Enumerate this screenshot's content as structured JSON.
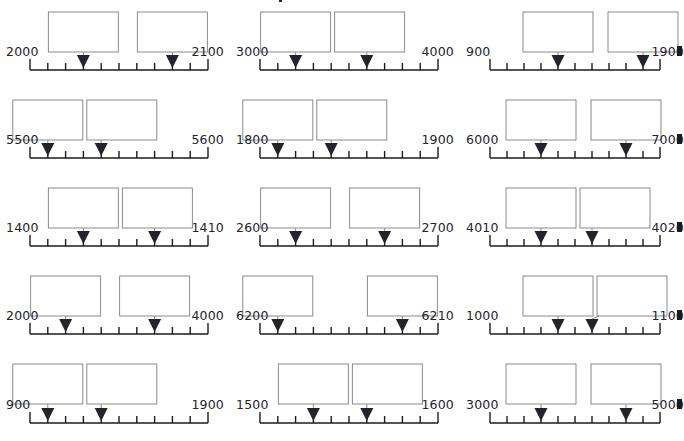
{
  "page": {
    "kind": "number-line-placement-exercise",
    "columns": 3,
    "rows": 5,
    "ticks_per_line": 11,
    "intervals_per_line": 10,
    "boxes_per_cell": 2,
    "arrows_per_cell": 2,
    "answer_box_text": "",
    "colors": {
      "ink": "#23232b",
      "box_stroke": "#8a8a90",
      "background": "#ffffff",
      "axis": "#1b1b1f"
    }
  },
  "cells": [
    {
      "id": "c1",
      "start_label": "2000",
      "end_label": "2100",
      "start_value": 2000,
      "end_value": 2100,
      "step": 10,
      "arrow_ticks": [
        3,
        8
      ],
      "arrow_values": [
        2030,
        2080
      ],
      "clipped_right": false
    },
    {
      "id": "c2",
      "start_label": "3000",
      "end_label": "4000",
      "start_value": 3000,
      "end_value": 4000,
      "step": 100,
      "arrow_ticks": [
        2,
        6
      ],
      "arrow_values": [
        3200,
        3600
      ],
      "clipped_right": false
    },
    {
      "id": "c3",
      "start_label": "900",
      "end_label": "1900",
      "start_value": 900,
      "end_value": 1900,
      "step": 100,
      "arrow_ticks": [
        4,
        9
      ],
      "arrow_values": [
        1300,
        1800
      ],
      "clipped_right": true
    },
    {
      "id": "c4",
      "start_label": "5500",
      "end_label": "5600",
      "start_value": 5500,
      "end_value": 5600,
      "step": 10,
      "arrow_ticks": [
        1,
        4
      ],
      "arrow_values": [
        5510,
        5540
      ],
      "clipped_right": false
    },
    {
      "id": "c5",
      "start_label": "1800",
      "end_label": "1900",
      "start_value": 1800,
      "end_value": 1900,
      "step": 10,
      "arrow_ticks": [
        1,
        4
      ],
      "arrow_values": [
        1810,
        1840
      ],
      "clipped_right": false
    },
    {
      "id": "c6",
      "start_label": "6000",
      "end_label": "7000",
      "start_value": 6000,
      "end_value": 7000,
      "step": 100,
      "arrow_ticks": [
        3,
        8
      ],
      "arrow_values": [
        6300,
        6800
      ],
      "clipped_right": true
    },
    {
      "id": "c7",
      "start_label": "1400",
      "end_label": "1410",
      "start_value": 1400,
      "end_value": 1410,
      "step": 1,
      "arrow_ticks": [
        3,
        7
      ],
      "arrow_values": [
        1403,
        1407
      ],
      "clipped_right": false
    },
    {
      "id": "c8",
      "start_label": "2600",
      "end_label": "2700",
      "start_value": 2600,
      "end_value": 2700,
      "step": 10,
      "arrow_ticks": [
        2,
        7
      ],
      "arrow_values": [
        2620,
        2670
      ],
      "clipped_right": false
    },
    {
      "id": "c9",
      "start_label": "4010",
      "end_label": "4020",
      "start_value": 4010,
      "end_value": 4020,
      "step": 1,
      "arrow_ticks": [
        3,
        6
      ],
      "arrow_values": [
        4013,
        4016
      ],
      "clipped_right": true
    },
    {
      "id": "c10",
      "start_label": "2000",
      "end_label": "4000",
      "start_value": 2000,
      "end_value": 4000,
      "step": 200,
      "arrow_ticks": [
        2,
        7
      ],
      "arrow_values": [
        2400,
        3400
      ],
      "clipped_right": false
    },
    {
      "id": "c11",
      "start_label": "6200",
      "end_label": "6210",
      "start_value": 6200,
      "end_value": 6210,
      "step": 1,
      "arrow_ticks": [
        1,
        8
      ],
      "arrow_values": [
        6201,
        6208
      ],
      "clipped_right": false
    },
    {
      "id": "c12",
      "start_label": "1000",
      "end_label": "1100",
      "start_value": 1000,
      "end_value": 1100,
      "step": 10,
      "arrow_ticks": [
        4,
        6
      ],
      "arrow_values": [
        1040,
        1060
      ],
      "clipped_right": true
    },
    {
      "id": "c13",
      "start_label": "900",
      "end_label": "1900",
      "start_value": 900,
      "end_value": 1900,
      "step": 100,
      "arrow_ticks": [
        1,
        4
      ],
      "arrow_values": [
        1000,
        1300
      ],
      "clipped_right": false
    },
    {
      "id": "c14",
      "start_label": "1500",
      "end_label": "1600",
      "start_value": 1500,
      "end_value": 1600,
      "step": 10,
      "arrow_ticks": [
        3,
        6
      ],
      "arrow_values": [
        1530,
        1560
      ],
      "clipped_right": false
    },
    {
      "id": "c15",
      "start_label": "3000",
      "end_label": "5000",
      "start_value": 3000,
      "end_value": 5000,
      "step": 200,
      "arrow_ticks": [
        3,
        8
      ],
      "arrow_values": [
        3600,
        4600
      ],
      "clipped_right": true
    }
  ]
}
